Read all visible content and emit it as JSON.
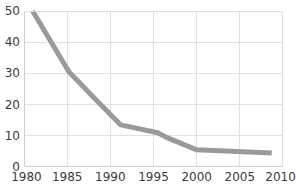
{
  "chart_data": {
    "type": "line",
    "title": "",
    "subtitle": "",
    "xlabel": "",
    "ylabel": "",
    "xlim": [
      1980,
      2010
    ],
    "ylim": [
      0,
      50
    ],
    "grid": true,
    "legend": null,
    "x_ticks": [
      1980,
      1985,
      1990,
      1995,
      2000,
      2005,
      2010
    ],
    "x_tick_labels": [
      "1980",
      "1985",
      "1990",
      "1995",
      "2000",
      "2005",
      "2010"
    ],
    "y_ticks": [
      0,
      10,
      20,
      30,
      40,
      50
    ],
    "y_tick_labels": [
      "0",
      "10",
      "20",
      "30",
      "40",
      "50"
    ],
    "series": [
      {
        "name": "series-1",
        "color": "#9a9a9a",
        "line_width": 5,
        "markers": false,
        "x": [
          1981.0,
          1985.2,
          1988.0,
          1991.2,
          1995.5,
          1996.5,
          2000.0,
          2008.7
        ],
        "values": [
          50.0,
          30.5,
          22.5,
          13.5,
          11.0,
          9.5,
          5.5,
          4.5
        ]
      }
    ]
  },
  "style": {
    "grid_color": "#e0e0e0",
    "axis_color": "#cfcfcf",
    "label_color": "#3b3b3b",
    "background": "#ffffff",
    "series_color": "#9a9a9a"
  }
}
